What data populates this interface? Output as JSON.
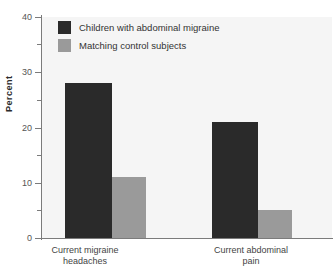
{
  "chart_data": {
    "type": "bar",
    "title": "",
    "subtitle": "",
    "xlabel": "",
    "ylabel": "Percent",
    "ylim": [
      0,
      40
    ],
    "ytick_labels": [
      "0",
      "10",
      "20",
      "30",
      "40"
    ],
    "ytick_values": [
      0,
      10,
      20,
      30,
      40
    ],
    "yminor_values": [
      5,
      15,
      25,
      35
    ],
    "grid": false,
    "legend_position": "top-left",
    "categories": [
      "Current migraine headaches",
      "Current abdominal pain"
    ],
    "category_lines": [
      [
        "Current migraine",
        "headaches"
      ],
      [
        "Current abdominal",
        "pain"
      ]
    ],
    "series": [
      {
        "name": "Children with abdominal migraine",
        "color": "#2a2a2a",
        "values": [
          28,
          21
        ]
      },
      {
        "name": "Matching control subjects",
        "color": "#9a9a9a",
        "values": [
          11,
          5
        ]
      }
    ]
  },
  "legend": {
    "items": [
      {
        "label": "Children with abdominal migraine",
        "swatch": "dark"
      },
      {
        "label": "Matching control subjects",
        "swatch": "light"
      }
    ]
  },
  "axes": {
    "y_title": "Percent",
    "y_labels": {
      "t0": "0",
      "t10": "10",
      "t20": "20",
      "t30": "30",
      "t40": "40"
    },
    "x_labels": {
      "g1_line1": "Current migraine",
      "g1_line2": "headaches",
      "g2_line1": "Current abdominal",
      "g2_line2": "pain"
    }
  },
  "colors": {
    "bar_dark": "#2a2a2a",
    "bar_light": "#9a9a9a",
    "plot_background": "#f5f5f5",
    "axis": "#7b7b7b",
    "page_background": "#ffffff"
  }
}
